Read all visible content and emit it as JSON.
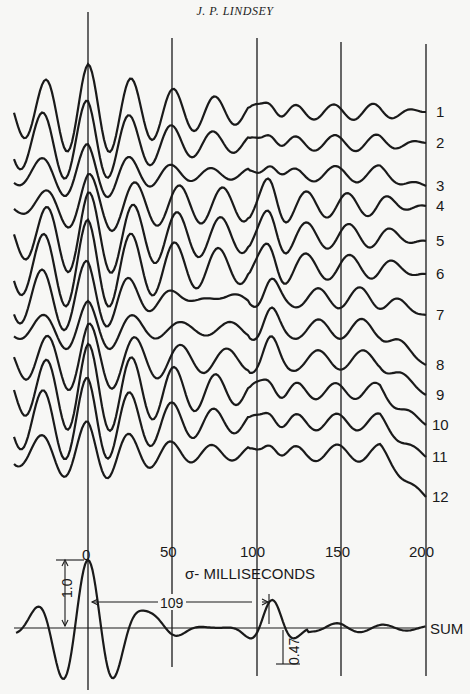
{
  "header": {
    "author": "J. P. LINDSEY"
  },
  "figure": {
    "x_axis": {
      "label": "σ- MILLISECONDS",
      "ticks": [
        "0",
        "50",
        "100",
        "150",
        "200"
      ],
      "tick_values": [
        0,
        50,
        100,
        150,
        200
      ]
    },
    "trace_labels": [
      "1",
      "2",
      "3",
      "4",
      "5",
      "6",
      "7",
      "8",
      "9",
      "10",
      "11",
      "12"
    ],
    "sum_label": "SUM",
    "annotations": {
      "peak_amplitude": "1.0",
      "lag": "109",
      "secondary_amplitude": "0.47"
    }
  },
  "chart_data": {
    "type": "line",
    "xlabel": "σ - milliseconds",
    "ylabel": "",
    "x_ticks": [
      0,
      50,
      100,
      150,
      200
    ],
    "xlim": [
      -30,
      200
    ],
    "grid": "vertical lines at 0, 50, 100, 150, 200",
    "series": [
      {
        "name": "1"
      },
      {
        "name": "2"
      },
      {
        "name": "3"
      },
      {
        "name": "4"
      },
      {
        "name": "5"
      },
      {
        "name": "6"
      },
      {
        "name": "7"
      },
      {
        "name": "8"
      },
      {
        "name": "9"
      },
      {
        "name": "10"
      },
      {
        "name": "11"
      },
      {
        "name": "12"
      },
      {
        "name": "SUM",
        "peak_at_ms": 0,
        "peak_value": 1.0,
        "secondary_peak_at_ms": 109,
        "secondary_peak_value": 0.47
      }
    ]
  }
}
